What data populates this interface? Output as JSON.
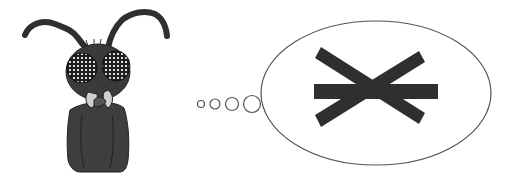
{
  "scene": {
    "description": "Cartoon fly thinking about a three-bar asterisk symbol",
    "character": "fly",
    "thought_symbol": "asterisk-three-bars",
    "bubble_count": 4
  },
  "colors": {
    "ink": "#2f2f2f",
    "body": "#3e3e3e",
    "outline": "#555555",
    "background": "#ffffff"
  }
}
